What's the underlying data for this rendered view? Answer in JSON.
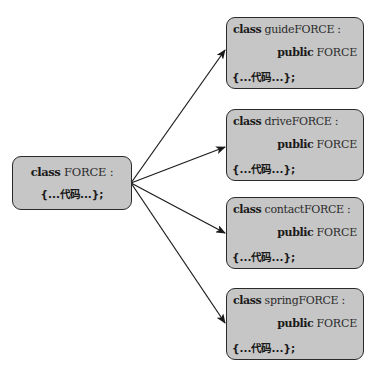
{
  "diagram": {
    "type": "class-inheritance",
    "colors": {
      "box_fill": "#c6c6c6",
      "box_border": "#2a2a2a",
      "arrow": "#1a1a1a"
    },
    "base": {
      "keyword": "class",
      "name": "FORCE :",
      "body": "{...代码...};"
    },
    "derived": [
      {
        "keyword": "class",
        "name": "guideFORCE :",
        "inherit_keyword": "public",
        "inherit_name": "FORCE",
        "body_open": "{...",
        "body_cn": "代码",
        "body_close": "...};"
      },
      {
        "keyword": "class",
        "name": "driveFORCE :",
        "inherit_keyword": "public",
        "inherit_name": "FORCE",
        "body_open": "{...",
        "body_cn": "代码",
        "body_close": "...};"
      },
      {
        "keyword": "class",
        "name": "contactFORCE :",
        "inherit_keyword": "public",
        "inherit_name": "FORCE",
        "body_open": "{...",
        "body_cn": "代码",
        "body_close": "...};"
      },
      {
        "keyword": "class",
        "name": "springFORCE :",
        "inherit_keyword": "public",
        "inherit_name": "FORCE",
        "body_open": "{...",
        "body_cn": "代码",
        "body_close": "...};"
      }
    ],
    "edges": [
      {
        "from": "FORCE",
        "to": "guideFORCE"
      },
      {
        "from": "FORCE",
        "to": "driveFORCE"
      },
      {
        "from": "FORCE",
        "to": "contactFORCE"
      },
      {
        "from": "FORCE",
        "to": "springFORCE"
      }
    ]
  }
}
